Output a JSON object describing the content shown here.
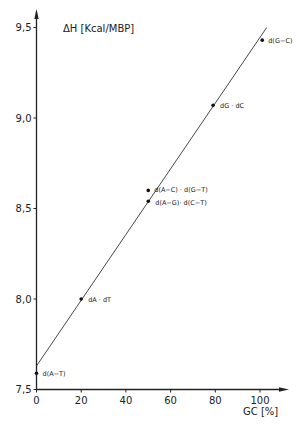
{
  "chart_data": {
    "type": "scatter",
    "title": "",
    "xlabel": "GC [%]",
    "ylabel": "ΔH [Kcal/MBP]",
    "xlim": [
      0,
      108
    ],
    "ylim": [
      7.5,
      9.6
    ],
    "x_ticks": [
      0,
      20,
      40,
      60,
      80,
      100
    ],
    "x_tick_labels": [
      "0",
      "20",
      "40",
      "60",
      "80",
      "100"
    ],
    "y_ticks": [
      7.5,
      8.0,
      8.5,
      9.0,
      9.5
    ],
    "y_tick_labels": [
      "7,5",
      "8,0",
      "8,5",
      "9,0",
      "9,5"
    ],
    "grid": false,
    "points": [
      {
        "label": "d(A−T)",
        "x": 0,
        "y": 7.59
      },
      {
        "label": "dA · dT",
        "x": 20,
        "y": 8.0
      },
      {
        "label": "d(A−C) · d(G−T)",
        "x": 50,
        "y": 8.6
      },
      {
        "label": "d(A−G)· d(C−T)",
        "x": 50,
        "y": 8.54
      },
      {
        "label": "dG · dC",
        "x": 79,
        "y": 9.07
      },
      {
        "label": "d(G−C)",
        "x": 101,
        "y": 9.43
      }
    ],
    "fit_line": {
      "x": [
        0,
        103
      ],
      "y": [
        7.63,
        9.5
      ]
    }
  }
}
